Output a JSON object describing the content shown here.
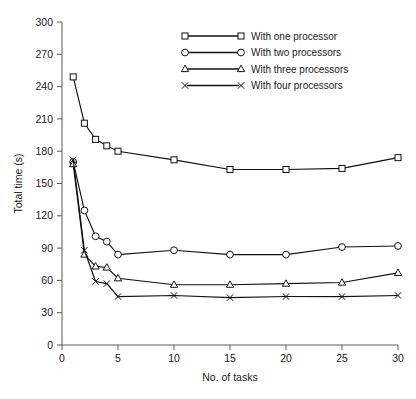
{
  "chart_data": {
    "type": "line",
    "title": "",
    "xlabel": "No. of tasks",
    "ylabel": "Total time (s)",
    "xlim": [
      0,
      30
    ],
    "ylim": [
      0,
      300
    ],
    "xticks": [
      0,
      5,
      10,
      15,
      20,
      25,
      30
    ],
    "yticks": [
      0,
      30,
      60,
      90,
      120,
      150,
      180,
      210,
      240,
      270,
      300
    ],
    "xticklabels": [
      "0",
      "5",
      "10",
      "15",
      "20",
      "25",
      "30"
    ],
    "yticklabels": [
      "0",
      "30",
      "60",
      "90",
      "120",
      "150",
      "180",
      "210",
      "240",
      "270",
      "300"
    ],
    "grid": false,
    "legend_position": "top-right",
    "x": [
      1,
      2,
      3,
      4,
      5,
      10,
      15,
      20,
      25,
      30
    ],
    "series": [
      {
        "name": "With one processor",
        "marker": "square",
        "values": [
          249,
          206,
          191,
          185,
          180,
          172,
          163,
          163,
          164,
          174
        ]
      },
      {
        "name": "With two processors",
        "marker": "circle",
        "values": [
          170,
          125,
          101,
          96,
          84,
          88,
          84,
          84,
          91,
          92
        ]
      },
      {
        "name": "With three processors",
        "marker": "triangle",
        "values": [
          168,
          84,
          73,
          72,
          62,
          56,
          56,
          57,
          58,
          67
        ]
      },
      {
        "name": "With four processors",
        "marker": "x",
        "values": [
          172,
          88,
          59,
          57,
          45,
          46,
          44,
          45,
          45,
          46
        ]
      }
    ]
  },
  "legend": {
    "entries": [
      {
        "label": "With one processor",
        "marker": "square-marker"
      },
      {
        "label": "With two processors",
        "marker": "circle-marker"
      },
      {
        "label": "With three processors",
        "marker": "triangle-marker"
      },
      {
        "label": "With four processors",
        "marker": "x-marker"
      }
    ]
  }
}
